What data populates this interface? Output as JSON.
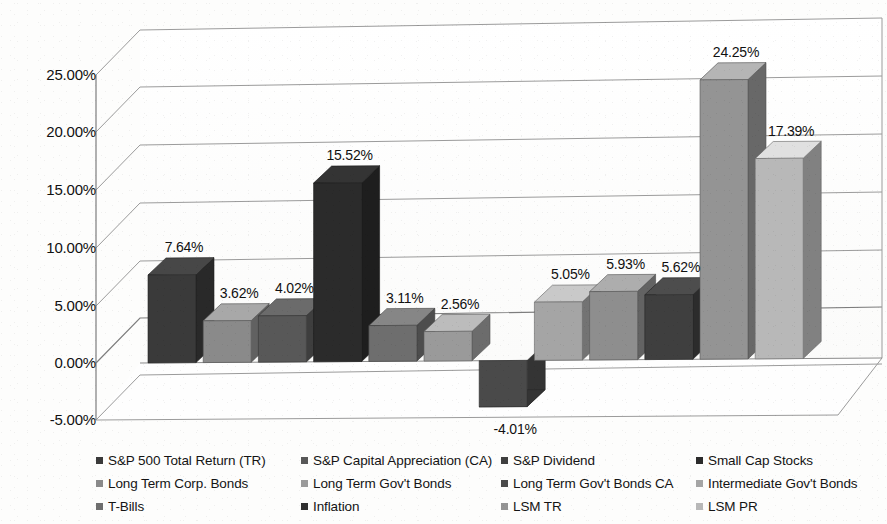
{
  "chart_data": {
    "type": "bar",
    "title": "",
    "xlabel": "",
    "ylabel": "",
    "ylim": [
      -5.0,
      27.5
    ],
    "yticks": [
      "-5.00%",
      "0.00%",
      "5.00%",
      "10.00%",
      "15.00%",
      "20.00%",
      "25.00%"
    ],
    "ytick_values": [
      -5.0,
      0.0,
      5.0,
      10.0,
      15.0,
      20.0,
      25.0
    ],
    "grid": true,
    "legend_position": "bottom",
    "value_suffix": "%",
    "categories": [
      "S&P 500 Total Return (TR)",
      "S&P Capital Appreciation (CA)",
      "S&P Dividend",
      "Small Cap Stocks",
      "Long Term Corp. Bonds",
      "Long Term Gov't Bonds",
      "Long Term Gov't Bonds CA",
      "Intermediate Gov't Bonds",
      "T-Bills",
      "Inflation",
      "LSM TR",
      "LSM PR"
    ],
    "values": [
      7.64,
      3.62,
      4.02,
      15.52,
      3.11,
      2.56,
      -4.01,
      5.05,
      5.93,
      5.62,
      24.25,
      17.39
    ],
    "labels": [
      "7.64%",
      "3.62%",
      "4.02%",
      "15.52%",
      "3.11%",
      "2.56%",
      "-4.01%",
      "5.05%",
      "5.93%",
      "5.62%",
      "24.25%",
      "17.39%"
    ],
    "colors": [
      "#3a3a3a",
      "#8a8a8a",
      "#585858",
      "#2b2b2b",
      "#6e6e6e",
      "#9a9a9a",
      "#4a4a4a",
      "#a5a5a5",
      "#8e8e8e",
      "#3f3f3f",
      "#949494",
      "#b8b8b8"
    ]
  },
  "legend": {
    "rows": [
      [
        {
          "label": "S&P 500 Total Return (TR)",
          "color": "#3a3a3a"
        },
        {
          "label": "S&P Capital Appreciation (CA)",
          "color": "#585858"
        },
        {
          "label": "S&P Dividend",
          "color": "#3f3f3f"
        },
        {
          "label": "Small Cap Stocks",
          "color": "#2b2b2b"
        }
      ],
      [
        {
          "label": "Long Term Corp. Bonds",
          "color": "#8a8a8a"
        },
        {
          "label": "Long Term Gov't Bonds",
          "color": "#9a9a9a"
        },
        {
          "label": "Long Term Gov't Bonds CA",
          "color": "#4a4a4a"
        },
        {
          "label": "Intermediate Gov't Bonds",
          "color": "#a5a5a5"
        }
      ],
      [
        {
          "label": "T-Bills",
          "color": "#6e6e6e"
        },
        {
          "label": "Inflation",
          "color": "#2f2f2f"
        },
        {
          "label": "LSM TR",
          "color": "#949494"
        },
        {
          "label": "LSM PR",
          "color": "#b8b8b8"
        }
      ]
    ]
  },
  "axis": {
    "ticks": [
      "25.00%",
      "20.00%",
      "15.00%",
      "10.00%",
      "5.00%",
      "0.00%",
      "-5.00%"
    ]
  }
}
